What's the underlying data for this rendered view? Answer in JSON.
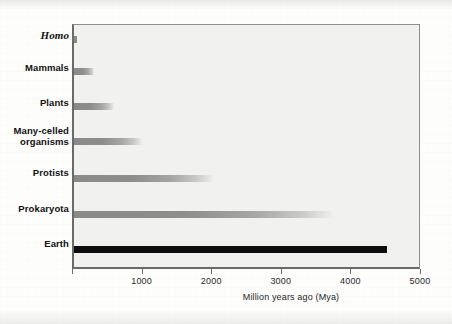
{
  "chart_data": {
    "type": "bar",
    "orientation": "horizontal",
    "title": "",
    "subtitle": "",
    "xlabel": "Million years ago (Mya)",
    "ylabel": "",
    "xlim": [
      0,
      5000
    ],
    "xticks": [
      0,
      1000,
      2000,
      3000,
      4000,
      5000
    ],
    "xticklabels": [
      "",
      "1000",
      "2000",
      "3000",
      "4000",
      "5000"
    ],
    "grid": false,
    "legend": null,
    "categories": [
      "Homo",
      "Mammals",
      "Plants",
      "Many-celled\norganisms",
      "Protists",
      "Prokaryota",
      "Earth"
    ],
    "values": [
      40,
      290,
      570,
      980,
      2000,
      3700,
      4500
    ],
    "series": [
      {
        "name": "First appearance (Mya)",
        "values": [
          40,
          290,
          570,
          980,
          2000,
          3700,
          4500
        ]
      }
    ],
    "bars": [
      {
        "label": "Homo",
        "value": 40,
        "style": "short",
        "italic": true
      },
      {
        "label": "Mammals",
        "value": 290,
        "style": "faded",
        "italic": false
      },
      {
        "label": "Plants",
        "value": 570,
        "style": "faded",
        "italic": false
      },
      {
        "label": "Many-celled\norganisms",
        "value": 980,
        "style": "faded",
        "italic": false
      },
      {
        "label": "Protists",
        "value": 2000,
        "style": "faded",
        "italic": false
      },
      {
        "label": "Prokaryota",
        "value": 3700,
        "style": "faded",
        "italic": false
      },
      {
        "label": "Earth",
        "value": 4500,
        "style": "solid",
        "italic": false
      }
    ]
  },
  "colors": {
    "plot_background": "#f1f1f0",
    "frame": "#6a6a68",
    "bar_gray": "#8a8a88",
    "bar_black": "#0d0d0d",
    "text": "#111111",
    "page_background": "#fdfdfc"
  }
}
